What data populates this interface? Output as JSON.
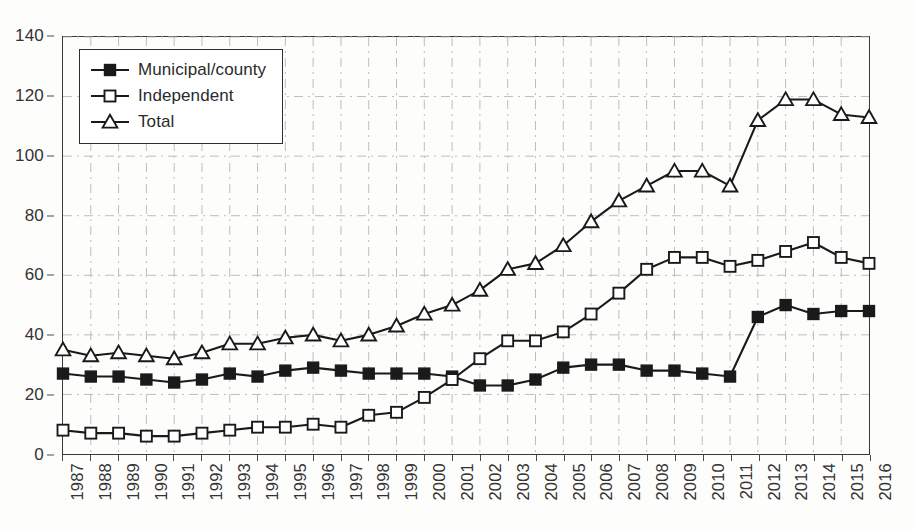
{
  "chart_data": {
    "type": "line",
    "title": "",
    "subtitle": "",
    "xlabel": "",
    "ylabel": "",
    "xlim": [
      1987,
      2016
    ],
    "ylim": [
      0,
      140
    ],
    "ytick_step": 20,
    "yticks": [
      0,
      20,
      40,
      60,
      80,
      100,
      120,
      140
    ],
    "grid": true,
    "grid_style": "dashed-light",
    "legend_position": "top-left-inside",
    "categories": [
      "1987",
      "1988",
      "1989",
      "1990",
      "1991",
      "1992",
      "1993",
      "1994",
      "1995",
      "1996",
      "1997",
      "1998",
      "1999",
      "2000",
      "2001",
      "2002",
      "2003",
      "2004",
      "2005",
      "2006",
      "2007",
      "2008",
      "2009",
      "2010",
      "2011",
      "2012",
      "2013",
      "2014",
      "2015",
      "2016"
    ],
    "series": [
      {
        "name": "Municipal/county",
        "marker": "filled-square",
        "color": "#1a1a1a",
        "values": [
          27,
          26,
          26,
          25,
          24,
          25,
          27,
          26,
          28,
          29,
          28,
          27,
          27,
          27,
          26,
          23,
          23,
          25,
          29,
          30,
          30,
          28,
          28,
          27,
          26,
          46,
          50,
          47,
          48,
          48
        ]
      },
      {
        "name": "Independent",
        "marker": "open-square",
        "color": "#1a1a1a",
        "values": [
          8,
          7,
          7,
          6,
          6,
          7,
          8,
          9,
          9,
          10,
          9,
          13,
          14,
          19,
          25,
          32,
          38,
          38,
          41,
          47,
          54,
          62,
          66,
          66,
          63,
          65,
          68,
          71,
          66,
          64
        ]
      },
      {
        "name": "Total",
        "marker": "open-triangle",
        "color": "#1a1a1a",
        "values": [
          35,
          33,
          34,
          33,
          32,
          34,
          37,
          37,
          39,
          40,
          38,
          40,
          43,
          47,
          50,
          55,
          62,
          64,
          70,
          78,
          85,
          90,
          95,
          95,
          90,
          112,
          119,
          119,
          114,
          113
        ]
      }
    ]
  },
  "legend": {
    "entries": [
      {
        "label": "Municipal/county",
        "marker": "filled-square"
      },
      {
        "label": "Independent",
        "marker": "open-square"
      },
      {
        "label": "Total",
        "marker": "open-triangle"
      }
    ]
  },
  "colors": {
    "ink": "#1a1a1a",
    "axis": "#3a3a3a",
    "grid": "#bdbdbd",
    "background": "#fdfdfc"
  }
}
